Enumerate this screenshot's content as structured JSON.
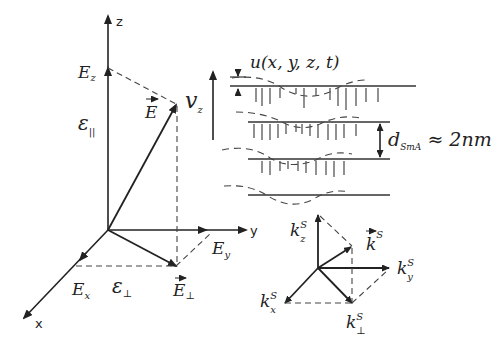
{
  "figure": {
    "axes": {
      "z": "z",
      "y": "y",
      "x": "x"
    },
    "field": {
      "E_vector": "E",
      "Ez": {
        "main": "E",
        "sub": "z"
      },
      "Ey": {
        "main": "E",
        "sub": "y"
      },
      "Ex": {
        "main": "E",
        "sub": "x"
      },
      "E_perp": {
        "main": "E",
        "sub": "⊥"
      },
      "eps_parallel": {
        "main": "ε",
        "sub": "||"
      },
      "eps_perp": {
        "main": "ε",
        "sub": "⊥"
      }
    },
    "smectic": {
      "velocity": {
        "main": "v",
        "sub": "z"
      },
      "displacement": "u(x, y, z, t)",
      "spacing": {
        "main": "d",
        "sub": "SmA",
        "rest": "≈ 2nm"
      }
    },
    "wavevector": {
      "k_vector": {
        "main": "k",
        "sup": "S"
      },
      "kz": {
        "main": "k",
        "sup": "S",
        "sub": "z"
      },
      "ky": {
        "main": "k",
        "sup": "S",
        "sub": "y"
      },
      "kx": {
        "main": "k",
        "sup": "S",
        "sub": "x"
      },
      "k_perp": {
        "main": "k",
        "sup": "S",
        "sub": "⊥"
      }
    }
  }
}
